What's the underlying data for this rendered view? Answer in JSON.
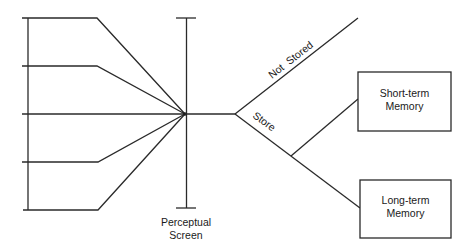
{
  "diagram": {
    "type": "flow-diagram",
    "input_channels": {
      "count": 5
    },
    "perceptual_screen": {
      "label_line1": "Perceptual",
      "label_line2": "Screen"
    },
    "branches": {
      "not_stored": {
        "label": "Not  Stored"
      },
      "store": {
        "label": "Store"
      }
    },
    "short_term": {
      "label_line1": "Short-term",
      "label_line2": "Memory"
    },
    "long_term": {
      "label_line1": "Long-term",
      "label_line2": "Memory"
    },
    "colors": {
      "line": "#2a2a2a",
      "text": "#1a1a1a",
      "background": "#ffffff"
    }
  }
}
